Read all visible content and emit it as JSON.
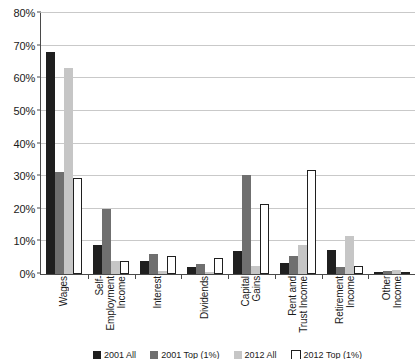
{
  "chart_data": {
    "type": "bar",
    "title": "",
    "xlabel": "",
    "ylabel": "",
    "ylim": [
      0,
      80
    ],
    "ytick_labels": [
      "0%",
      "10%",
      "20%",
      "30%",
      "40%",
      "50%",
      "60%",
      "70%",
      "80%"
    ],
    "ytick_values": [
      0,
      10,
      20,
      30,
      40,
      50,
      60,
      70,
      80
    ],
    "grid": true,
    "legend_position": "bottom",
    "categories": [
      "Wages",
      "Self-\nEmployment\nIncome",
      "Interest",
      "Dividends",
      "Capital\nGains",
      "Rent and\nTrust Income",
      "Retirement\nIncome",
      "Other\nIncome"
    ],
    "series": [
      {
        "name": "2001 All",
        "color": "#1f1f1f",
        "values": [
          68.0,
          9.0,
          4.0,
          2.0,
          7.0,
          3.5,
          7.5,
          0.7
        ]
      },
      {
        "name": "2001 Top (1%)",
        "color": "#6f6f6f",
        "values": [
          31.3,
          20.0,
          6.0,
          3.0,
          30.2,
          5.5,
          2.0,
          1.0
        ]
      },
      {
        "name": "2012 All",
        "color": "#c6c6c6",
        "values": [
          63.0,
          4.0,
          1.0,
          0.5,
          2.5,
          9.0,
          11.5,
          1.2
        ]
      },
      {
        "name": "2012 Top (1%)",
        "color": "#ffffff",
        "values": [
          29.3,
          4.0,
          5.5,
          5.0,
          21.5,
          32.0,
          2.5,
          0.5
        ]
      }
    ]
  }
}
